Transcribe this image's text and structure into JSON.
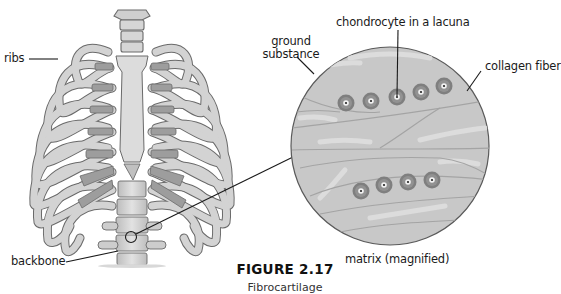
{
  "figure": {
    "title": "FIGURE 2.17",
    "caption": "Fibrocartilage"
  },
  "labels": {
    "ribs": "ribs",
    "backbone": "backbone",
    "ground_substance_line1": "ground",
    "ground_substance_line2": "substance",
    "chondrocyte": "chondrocyte in a lacuna",
    "collagen_fiber": "collagen fiber",
    "matrix": "matrix (magnified)"
  },
  "colors": {
    "bone_fill": "#d4d4d4",
    "bone_stroke": "#6a6a6a",
    "cartilage_fill": "#9a9a9a",
    "matrix_fill": "#c9c9c9",
    "matrix_stroke": "#5a5a5a",
    "lacuna_fill": "#7d7d7d",
    "leader_line": "#1a1a1a"
  }
}
